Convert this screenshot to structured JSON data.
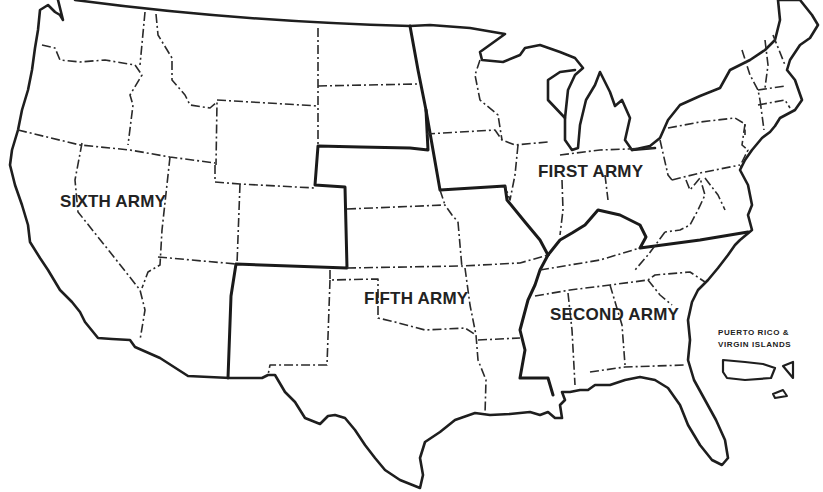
{
  "map": {
    "title": "",
    "colors": {
      "background": "#ffffff",
      "ink": "#1e1e1e"
    },
    "regions": [
      {
        "id": "sixth",
        "label": "SIXTH ARMY"
      },
      {
        "id": "fifth",
        "label": "FIFTH ARMY"
      },
      {
        "id": "first",
        "label": "FIRST ARMY"
      },
      {
        "id": "second",
        "label": "SECOND ARMY"
      }
    ],
    "inset": {
      "label_line1": "PUERTO RICO &",
      "label_line2": "VIRGIN ISLANDS"
    }
  }
}
